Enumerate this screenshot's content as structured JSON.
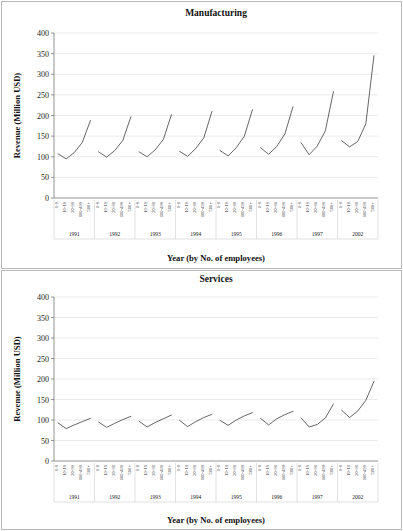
{
  "figure": {
    "panels": [
      "manufacturing",
      "services"
    ]
  },
  "chart_data": [
    {
      "type": "line",
      "title": "Manufacturing",
      "xlabel": "Year (by No. of employees)",
      "ylabel": "Revenue (Million USD)",
      "ylim": [
        0,
        400
      ],
      "yticks": [
        0,
        50,
        100,
        150,
        200,
        250,
        300,
        350,
        400
      ],
      "grid": true,
      "legend": "none",
      "categories": [
        "1-9",
        "10-19",
        "20-99",
        "100-499",
        "500+"
      ],
      "groups": [
        "1991",
        "1992",
        "1993",
        "1994",
        "1995",
        "1996",
        "1997",
        "2002"
      ],
      "series": [
        {
          "name": "1991",
          "values": [
            107,
            95,
            110,
            135,
            188
          ]
        },
        {
          "name": "1992",
          "values": [
            112,
            99,
            115,
            140,
            197
          ]
        },
        {
          "name": "1993",
          "values": [
            112,
            100,
            117,
            142,
            202
          ]
        },
        {
          "name": "1994",
          "values": [
            113,
            101,
            120,
            146,
            210
          ]
        },
        {
          "name": "1995",
          "values": [
            115,
            102,
            122,
            150,
            214
          ]
        },
        {
          "name": "1996",
          "values": [
            122,
            106,
            125,
            155,
            221
          ]
        },
        {
          "name": "1997",
          "values": [
            134,
            105,
            126,
            163,
            258
          ]
        },
        {
          "name": "2002",
          "values": [
            139,
            124,
            137,
            180,
            345
          ]
        }
      ]
    },
    {
      "type": "line",
      "title": "Services",
      "xlabel": "Year (by No. of employees)",
      "ylabel": "Revenue (Million USD)",
      "ylim": [
        0,
        400
      ],
      "yticks": [
        0,
        50,
        100,
        150,
        200,
        250,
        300,
        350,
        400
      ],
      "grid": true,
      "legend": "none",
      "categories": [
        "1-9",
        "10-19",
        "20-99",
        "100-499",
        "500+"
      ],
      "groups": [
        "1991",
        "1992",
        "1993",
        "1994",
        "1995",
        "1996",
        "1997",
        "2002"
      ],
      "series": [
        {
          "name": "1991",
          "values": [
            93,
            79,
            88,
            96,
            104
          ]
        },
        {
          "name": "1992",
          "values": [
            95,
            82,
            92,
            101,
            109
          ]
        },
        {
          "name": "1993",
          "values": [
            97,
            83,
            94,
            103,
            112
          ]
        },
        {
          "name": "1994",
          "values": [
            99,
            84,
            96,
            106,
            114
          ]
        },
        {
          "name": "1995",
          "values": [
            99,
            87,
            100,
            110,
            118
          ]
        },
        {
          "name": "1996",
          "values": [
            104,
            88,
            103,
            113,
            121
          ]
        },
        {
          "name": "1997",
          "values": [
            105,
            83,
            89,
            105,
            139
          ]
        },
        {
          "name": "2002",
          "values": [
            124,
            106,
            122,
            148,
            194
          ]
        }
      ]
    }
  ]
}
